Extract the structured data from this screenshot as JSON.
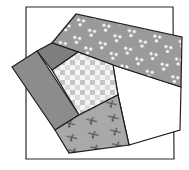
{
  "diagram": {
    "type": "quilt-block",
    "canvas": {
      "width": 189,
      "height": 170,
      "background": "#ffffff"
    },
    "outline": {
      "name": "block-square",
      "points": "26,7 173,7 174,159 26,159",
      "stroke": "#2b2b2b"
    },
    "patches": [
      {
        "name": "white-pentagon-patch",
        "fabric": "plain-white",
        "points": "113,65 181,87 180,130 129,145 118,95",
        "fill": "#ffffff"
      },
      {
        "name": "dotted-band-patch",
        "fabric": "gray-with-white-dots",
        "points": "52,43 76,14 182,37 181,87 113,65 78,52",
        "fill": "#9a9a9a",
        "dot_color": "#ffffff"
      },
      {
        "name": "checkered-pentagon-patch",
        "fabric": "gray-checkerboard",
        "points": "52,70 78,52 113,65 118,95 79,115",
        "fill": "#ffffff",
        "check_color_a": "#c8c8c8",
        "check_color_b": "#e9e9e9"
      },
      {
        "name": "dark-connector-patch",
        "fabric": "solid-dark-gray",
        "points": "37,51 52,43 78,52 52,70",
        "fill": "#7f7f7f"
      },
      {
        "name": "left-strip-patch",
        "fabric": "solid-gray",
        "points": "12,67 37,51 79,115 55,130",
        "fill": "#8c8c8c"
      },
      {
        "name": "scissors-print-patch",
        "fabric": "gray-with-scissors-motif",
        "points": "55,130 79,115 118,95 129,145 69,153",
        "fill": "#a9a9a9",
        "motif_color": "#4f4f4f"
      }
    ],
    "stroke_color": "#1e1e1e"
  }
}
